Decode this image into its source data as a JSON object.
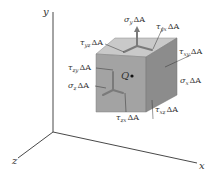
{
  "diagram": {
    "axes": {
      "x": {
        "label": "x"
      },
      "y": {
        "label": "y"
      },
      "z": {
        "label": "z"
      }
    },
    "point": {
      "label": "Q"
    },
    "forces": [
      {
        "id": "sigma_y",
        "symbol": "σ",
        "subscript": "y",
        "suffix": "ΔA"
      },
      {
        "id": "tau_yx",
        "symbol": "τ",
        "subscript": "yx",
        "suffix": "ΔA"
      },
      {
        "id": "tau_yz",
        "symbol": "τ",
        "subscript": "yz",
        "suffix": "ΔA"
      },
      {
        "id": "tau_zy",
        "symbol": "τ",
        "subscript": "zy",
        "suffix": "ΔA"
      },
      {
        "id": "sigma_z",
        "symbol": "σ",
        "subscript": "z",
        "suffix": "ΔA"
      },
      {
        "id": "tau_xy",
        "symbol": "τ",
        "subscript": "xy",
        "suffix": "ΔA"
      },
      {
        "id": "sigma_x",
        "symbol": "σ",
        "subscript": "x",
        "suffix": "ΔA"
      },
      {
        "id": "tau_zx",
        "symbol": "τ",
        "subscript": "zx",
        "suffix": "ΔA"
      },
      {
        "id": "tau_xz",
        "symbol": "τ",
        "subscript": "xz",
        "suffix": "ΔA"
      }
    ],
    "colors": {
      "top_face": "#c9c9c9",
      "front_face": "#a3a3a3",
      "right_face": "#8c8c8c",
      "arrow": "#7a7a7a",
      "axis": "#333333"
    }
  }
}
